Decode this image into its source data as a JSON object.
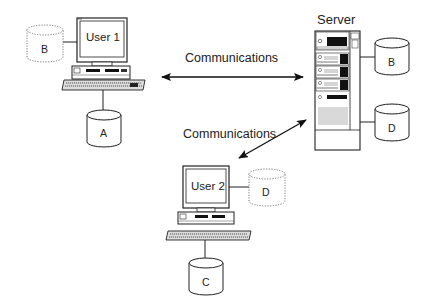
{
  "diagram": {
    "type": "network-topology",
    "nodes": {
      "user1": {
        "label": "User 1",
        "local_disk": "A",
        "cached_disk": "B"
      },
      "user2": {
        "label": "User 2",
        "local_disk": "C",
        "cached_disk": "D"
      },
      "server": {
        "label": "Server",
        "disks": [
          "B",
          "D"
        ]
      }
    },
    "links": [
      {
        "from": "user1",
        "to": "server",
        "label": "Communications",
        "bidirectional": true
      },
      {
        "from": "user2",
        "to": "server",
        "label": "Communications",
        "bidirectional": true
      }
    ],
    "legend_notes": {
      "dotted_cylinder": "cached/remote copy",
      "solid_cylinder": "local storage"
    }
  },
  "labels": {
    "user1": "User 1",
    "user2": "User 2",
    "server": "Server",
    "comm_top": "Communications",
    "comm_bottom": "Communications",
    "disk_b_user1": "B",
    "disk_a": "A",
    "disk_b_server": "B",
    "disk_d_server": "D",
    "disk_d_user2": "D",
    "disk_c": "C"
  },
  "colors": {
    "line": "#222222",
    "fill": "#ffffff",
    "dark": "#111111",
    "dotted": "#777777"
  }
}
